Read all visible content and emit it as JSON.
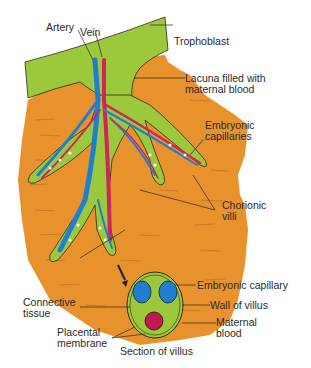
{
  "figure": {
    "top_fragment": "...",
    "labels": {
      "artery": "Artery",
      "vein": "Vein",
      "trophoblast": "Trophoblast",
      "lacuna": "Lacuna filled with\nmaternal blood",
      "embryonic_capillaries": "Embryonic\ncapillaries",
      "chorionic_villi": "Chorionic\nvilli",
      "embryonic_capillary": "Embryonic capillary",
      "connective_tissue": "Connective\ntissue",
      "wall_of_villus": "Wall of villus",
      "maternal_blood": "Maternal\nblood",
      "placental_membrane": "Placental\nmembrane",
      "section_of_villus": "Section of villus"
    },
    "colors": {
      "maternal_tissue": "#E8922E",
      "trophoblast_green": "#9CC83C",
      "artery_blue": "#1E7FD0",
      "vein_red": "#D0245A",
      "outline": "#2a2a1a",
      "label_text": "#2a2a2a"
    }
  }
}
